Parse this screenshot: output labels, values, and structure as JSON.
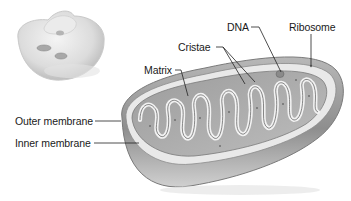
{
  "diagram": {
    "inset": {
      "description": "cell illustration showing organelle location"
    },
    "labels": [
      {
        "id": "dna",
        "text": "DNA"
      },
      {
        "id": "ribosome",
        "text": "Ribosome"
      },
      {
        "id": "cristae",
        "text": "Cristae"
      },
      {
        "id": "matrix",
        "text": "Matrix"
      },
      {
        "id": "outer_membrane",
        "text": "Outer membrane"
      },
      {
        "id": "inner_membrane",
        "text": "Inner membrane"
      }
    ],
    "colors": {
      "outer": "#9a9a9a",
      "inner_fill": "#c8c8c8",
      "membrane_highlight": "#f2f2f2",
      "shadow": "#6e6e6e",
      "leader": "#222222",
      "text": "#1a1a1a"
    }
  }
}
